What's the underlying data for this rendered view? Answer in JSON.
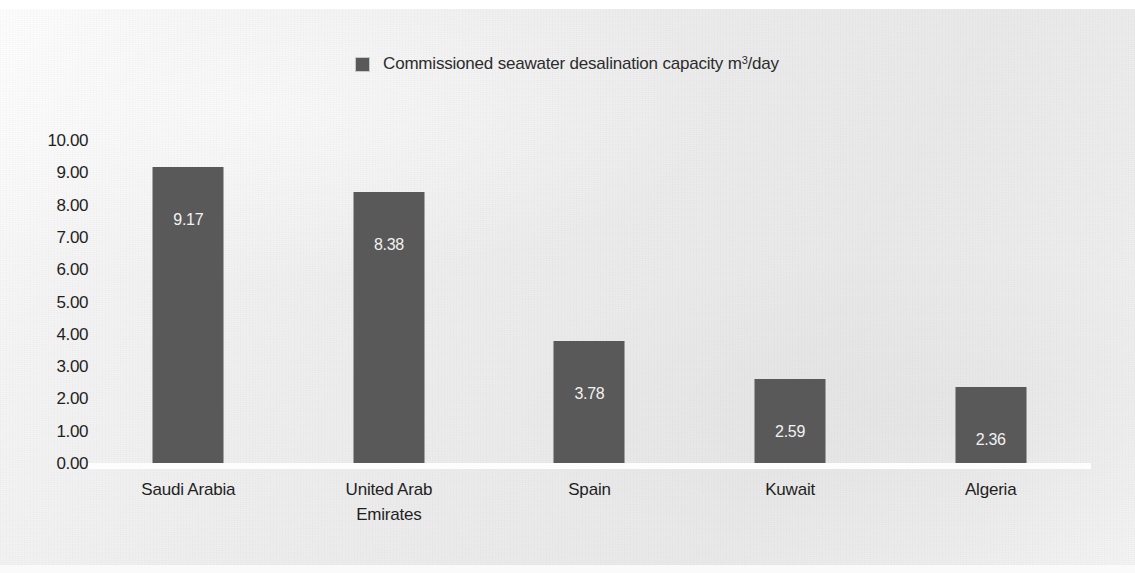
{
  "chart_data": {
    "type": "bar",
    "title": "",
    "subtitle": "",
    "xlabel": "",
    "ylabel": "",
    "categories": [
      "Saudi Arabia",
      "United Arab Emirates",
      "Spain",
      "Kuwait",
      "Algeria"
    ],
    "values": [
      9.17,
      8.38,
      3.78,
      2.59,
      2.36
    ],
    "value_labels": [
      "9.17",
      "8.38",
      "3.78",
      "2.59",
      "2.36"
    ],
    "series": [
      {
        "name": "Commissioned seawater desalination capacity m³/day",
        "values": [
          9.17,
          8.38,
          3.78,
          2.59,
          2.36
        ],
        "color": "#595959"
      }
    ],
    "ylim": [
      0,
      10
    ],
    "y_tick_step": 1,
    "y_ticks": [
      "10.00",
      "9.00",
      "8.00",
      "7.00",
      "6.00",
      "5.00",
      "4.00",
      "3.00",
      "2.00",
      "1.00",
      "0.00"
    ],
    "y_tick_values": [
      10,
      9,
      8,
      7,
      6,
      5,
      4,
      3,
      2,
      1,
      0
    ],
    "grid": false,
    "legend_position": "top-center",
    "bar_color": "#595959",
    "value_label_color": "#f2f2f2",
    "axis_line_color": "#fdfdfd",
    "background_color": "#ededed"
  },
  "legend": {
    "swatch_name": "series-color-swatch",
    "label_main": "Commissioned seawater desalination capacity m",
    "label_sup": "3",
    "label_tail": "/day",
    "label_full": "Commissioned seawater desalination capacity m³/day"
  },
  "axis": {
    "y_ticks": [
      "10.00",
      "9.00",
      "8.00",
      "7.00",
      "6.00",
      "5.00",
      "4.00",
      "3.00",
      "2.00",
      "1.00",
      "0.00"
    ]
  },
  "categories": [
    {
      "line1": "Saudi Arabia",
      "line2": ""
    },
    {
      "line1": "United Arab",
      "line2": "Emirates"
    },
    {
      "line1": "Spain",
      "line2": ""
    },
    {
      "line1": "Kuwait",
      "line2": ""
    },
    {
      "line1": "Algeria",
      "line2": ""
    }
  ],
  "bars": [
    {
      "label": "9.17"
    },
    {
      "label": "8.38"
    },
    {
      "label": "3.78"
    },
    {
      "label": "2.59"
    },
    {
      "label": "2.36"
    }
  ]
}
